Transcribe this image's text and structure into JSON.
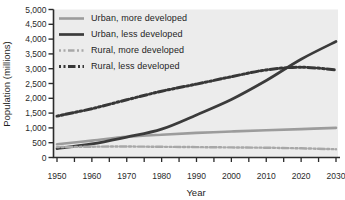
{
  "figure": {
    "background": "#ffffff",
    "plot_background": "#ececec",
    "axis_color": "#2b2b2b",
    "text_color": "#242424"
  },
  "chart_data": {
    "type": "line",
    "title": "",
    "xlabel": "Year",
    "ylabel": "Population (millions)",
    "xlim": [
      1950,
      2030
    ],
    "ylim": [
      0,
      5000
    ],
    "x": [
      1950,
      1960,
      1970,
      1980,
      1990,
      2000,
      2010,
      2020,
      2030
    ],
    "x_tick_labels": [
      "1950",
      "1960",
      "1970",
      "1980",
      "1990",
      "2000",
      "2010",
      "2020",
      "2030"
    ],
    "x_minor_step": 5,
    "y_ticks": [
      0,
      500,
      1000,
      1500,
      2000,
      2500,
      3000,
      3500,
      4000,
      4500,
      5000
    ],
    "y_tick_labels": [
      "0",
      "500",
      "1,000",
      "1,500",
      "2,000",
      "2,500",
      "3,000",
      "3,500",
      "4,000",
      "4,500",
      "5,000"
    ],
    "grid": false,
    "legend_position": "inside-top-left",
    "series": [
      {
        "name": "Urban, more developed",
        "color": "#9c9c9c",
        "dash": "none",
        "width": 2.6,
        "values": [
          450,
          570,
          700,
          770,
          830,
          880,
          920,
          960,
          1000
        ]
      },
      {
        "name": "Urban, less developed",
        "color": "#3b3b3b",
        "dash": "none",
        "width": 2.7,
        "values": [
          300,
          460,
          690,
          960,
          1440,
          1960,
          2600,
          3320,
          3920
        ]
      },
      {
        "name": "Rural, more developed",
        "color": "#a8a8a8",
        "dash": "2 2.5 2 2.5 6.5 2.5",
        "width": 2.4,
        "values": [
          350,
          365,
          370,
          360,
          350,
          340,
          330,
          310,
          280
        ]
      },
      {
        "name": "Rural, less developed",
        "color": "#373737",
        "dash": "2 2.5 2 2.5 7.5 2.5",
        "width": 3,
        "values": [
          1400,
          1650,
          1950,
          2240,
          2480,
          2730,
          2960,
          3050,
          2960
        ]
      }
    ]
  }
}
